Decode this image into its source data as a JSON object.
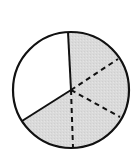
{
  "diagram": {
    "type": "fraction-circle",
    "center": [
      71,
      90
    ],
    "radius": 58,
    "colors": {
      "stroke": "#111111",
      "shaded": "#d9d9d9",
      "unshaded": "#ffffff"
    },
    "solid_divisions": 3,
    "dashed_subdivisions": 6,
    "shaded_fraction": "2/3",
    "shaded_sixths": "4/6",
    "solid_line_angles_deg": [
      -92,
      150
    ],
    "dashed_line_angles_deg": [
      -30,
      30,
      88
    ]
  }
}
